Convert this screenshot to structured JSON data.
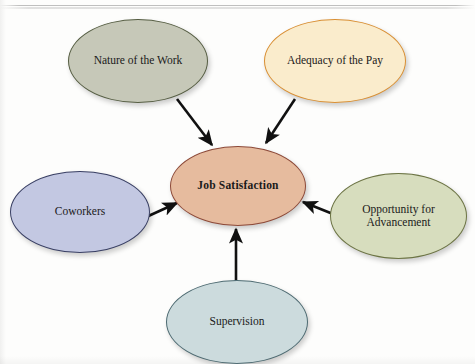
{
  "figure": {
    "type": "concept-map",
    "center": {
      "id": "job-satisfaction",
      "label": "Job Satisfaction",
      "fill": "#e6bb9e",
      "stroke": "#8d4a39"
    },
    "nodes": [
      {
        "id": "nature-of-the-work",
        "label": "Nature of the Work",
        "position": "top-left",
        "fill": "#c6c8b8",
        "stroke": "#555d42"
      },
      {
        "id": "adequacy-of-the-pay",
        "label": "Adequacy of the Pay",
        "position": "top-right",
        "fill": "#faeccc",
        "stroke": "#d98f33"
      },
      {
        "id": "coworkers",
        "label": "Coworkers",
        "position": "left",
        "fill": "#c3c8e2",
        "stroke": "#3a4064"
      },
      {
        "id": "opportunity-for-advancement",
        "label": "Opportunity for\nAdvancement",
        "label_line1": "Opportunity for",
        "label_line2": "Advancement",
        "position": "right",
        "fill": "#d7ddbe",
        "stroke": "#6c7444"
      },
      {
        "id": "supervision",
        "label": "Supervision",
        "position": "bottom",
        "fill": "#ccdbdd",
        "stroke": "#4e6b72"
      }
    ],
    "arrows": [
      {
        "from": "nature-of-the-work",
        "to": "job-satisfaction",
        "direction": "down-right"
      },
      {
        "from": "adequacy-of-the-pay",
        "to": "job-satisfaction",
        "direction": "down-left"
      },
      {
        "from": "coworkers",
        "to": "job-satisfaction",
        "direction": "up-right"
      },
      {
        "from": "opportunity-for-advancement",
        "to": "job-satisfaction",
        "direction": "up-left"
      },
      {
        "from": "supervision",
        "to": "job-satisfaction",
        "direction": "up"
      }
    ],
    "arrow_color": "#111111"
  }
}
